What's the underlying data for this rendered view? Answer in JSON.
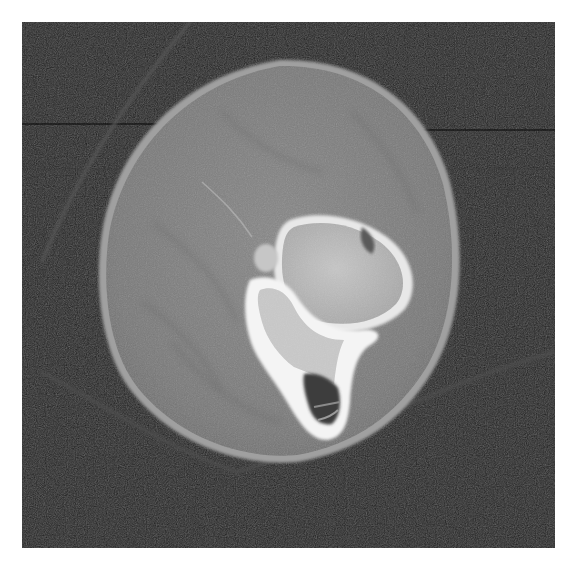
{
  "figure": {
    "type": "axial CT scan",
    "colors": {
      "background": "#ffffff",
      "scan_background": "#1e1e1e",
      "soft_tissue": "#7a7a7a",
      "skin_edge": "#a5a5a5",
      "bone_cortex": "#f2f2f2",
      "bone_marrow": "#b8b8b8",
      "dark_cavity": "#3c3c3c"
    }
  }
}
